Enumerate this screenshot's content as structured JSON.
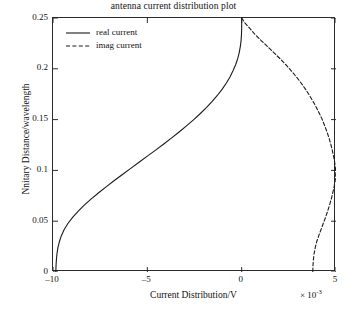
{
  "chart_data": {
    "type": "line",
    "title": "antenna current distribution plot",
    "xlabel": "Current Distribution/V",
    "ylabel": "Nnitary Distance/wavelength",
    "x_exponent_label": "× 10",
    "x_exponent_power": "-3",
    "xlim": [
      -10,
      5
    ],
    "ylim": [
      0,
      0.25
    ],
    "grid": false,
    "legend_position": "top-left",
    "xticks": [
      -10,
      -5,
      0,
      5
    ],
    "xtick_labels": [
      "–10",
      "–5",
      "0",
      "5"
    ],
    "yticks": [
      0,
      0.05,
      0.1,
      0.15,
      0.2,
      0.25
    ],
    "ytick_labels": [
      "0",
      "0.05",
      "0.1",
      "0.15",
      "0.2",
      "0.25"
    ],
    "series": [
      {
        "name": "real current",
        "style": "solid",
        "color": "#1a1a1a",
        "points": [
          [
            -9.85,
            0.0
          ],
          [
            -9.84,
            0.006
          ],
          [
            -9.82,
            0.012
          ],
          [
            -9.79,
            0.018
          ],
          [
            -9.74,
            0.024
          ],
          [
            -9.66,
            0.03
          ],
          [
            -9.55,
            0.036
          ],
          [
            -9.4,
            0.042
          ],
          [
            -9.2,
            0.048
          ],
          [
            -8.95,
            0.054
          ],
          [
            -8.66,
            0.06
          ],
          [
            -8.33,
            0.066
          ],
          [
            -7.97,
            0.072
          ],
          [
            -7.58,
            0.078
          ],
          [
            -7.17,
            0.084
          ],
          [
            -6.75,
            0.09
          ],
          [
            -6.32,
            0.096
          ],
          [
            -5.88,
            0.102
          ],
          [
            -5.44,
            0.108
          ],
          [
            -5.0,
            0.114
          ],
          [
            -4.56,
            0.12
          ],
          [
            -4.13,
            0.126
          ],
          [
            -3.71,
            0.132
          ],
          [
            -3.3,
            0.138
          ],
          [
            -2.91,
            0.144
          ],
          [
            -2.54,
            0.15
          ],
          [
            -2.19,
            0.156
          ],
          [
            -1.86,
            0.162
          ],
          [
            -1.56,
            0.168
          ],
          [
            -1.28,
            0.174
          ],
          [
            -1.03,
            0.18
          ],
          [
            -0.81,
            0.186
          ],
          [
            -0.62,
            0.192
          ],
          [
            -0.46,
            0.198
          ],
          [
            -0.32,
            0.204
          ],
          [
            -0.21,
            0.21
          ],
          [
            -0.13,
            0.216
          ],
          [
            -0.07,
            0.222
          ],
          [
            -0.03,
            0.228
          ],
          [
            -0.01,
            0.234
          ],
          [
            0.0,
            0.24
          ],
          [
            0.0,
            0.246
          ],
          [
            0.0,
            0.25
          ]
        ]
      },
      {
        "name": "imag current",
        "style": "dashed",
        "color": "#1a1a1a",
        "points": [
          [
            0.0,
            0.25
          ],
          [
            0.18,
            0.245
          ],
          [
            0.42,
            0.24
          ],
          [
            0.7,
            0.234
          ],
          [
            1.02,
            0.228
          ],
          [
            1.36,
            0.222
          ],
          [
            1.7,
            0.216
          ],
          [
            2.03,
            0.21
          ],
          [
            2.34,
            0.204
          ],
          [
            2.63,
            0.198
          ],
          [
            2.9,
            0.192
          ],
          [
            3.15,
            0.186
          ],
          [
            3.38,
            0.18
          ],
          [
            3.59,
            0.174
          ],
          [
            3.78,
            0.168
          ],
          [
            3.96,
            0.162
          ],
          [
            4.12,
            0.156
          ],
          [
            4.27,
            0.15
          ],
          [
            4.4,
            0.144
          ],
          [
            4.52,
            0.138
          ],
          [
            4.63,
            0.132
          ],
          [
            4.72,
            0.126
          ],
          [
            4.8,
            0.12
          ],
          [
            4.87,
            0.114
          ],
          [
            4.93,
            0.108
          ],
          [
            4.97,
            0.102
          ],
          [
            4.99,
            0.098
          ],
          [
            4.98,
            0.094
          ],
          [
            4.95,
            0.089
          ],
          [
            4.9,
            0.084
          ],
          [
            4.83,
            0.078
          ],
          [
            4.75,
            0.072
          ],
          [
            4.66,
            0.066
          ],
          [
            4.56,
            0.06
          ],
          [
            4.45,
            0.054
          ],
          [
            4.33,
            0.048
          ],
          [
            4.21,
            0.042
          ],
          [
            4.09,
            0.036
          ],
          [
            3.98,
            0.03
          ],
          [
            3.9,
            0.024
          ],
          [
            3.84,
            0.018
          ],
          [
            3.8,
            0.012
          ],
          [
            3.78,
            0.006
          ],
          [
            3.77,
            0.0
          ]
        ]
      }
    ]
  }
}
